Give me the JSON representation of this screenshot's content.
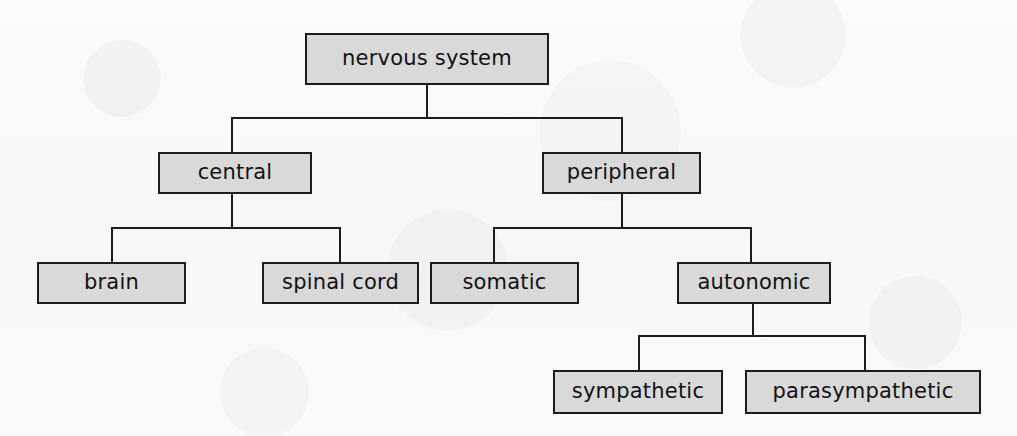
{
  "diagram": {
    "style": {
      "box_fill": "#d9d9d9",
      "box_border": "#1c1c1c",
      "text_color": "#121212",
      "background": "#fdfdfc",
      "line_color": "#1c1c1c"
    },
    "nodes": {
      "root": {
        "label": "nervous system",
        "level": 0
      },
      "central": {
        "label": "central",
        "level": 1
      },
      "peripheral": {
        "label": "peripheral",
        "level": 1
      },
      "brain": {
        "label": "brain",
        "level": 2
      },
      "spinal_cord": {
        "label": "spinal cord",
        "level": 2
      },
      "somatic": {
        "label": "somatic",
        "level": 2
      },
      "autonomic": {
        "label": "autonomic",
        "level": 2
      },
      "sympathetic": {
        "label": "sympathetic",
        "level": 3
      },
      "parasympathetic": {
        "label": "parasympathetic",
        "level": 3
      }
    },
    "edges": [
      {
        "from": "root",
        "to": "central"
      },
      {
        "from": "root",
        "to": "peripheral"
      },
      {
        "from": "central",
        "to": "brain"
      },
      {
        "from": "central",
        "to": "spinal_cord"
      },
      {
        "from": "peripheral",
        "to": "somatic"
      },
      {
        "from": "peripheral",
        "to": "autonomic"
      },
      {
        "from": "autonomic",
        "to": "sympathetic"
      },
      {
        "from": "autonomic",
        "to": "parasympathetic"
      }
    ]
  }
}
